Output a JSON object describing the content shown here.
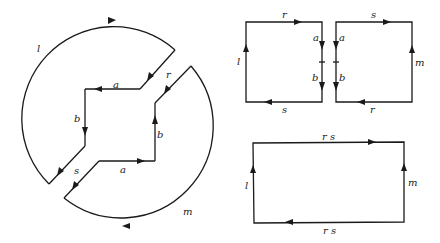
{
  "figure": {
    "left_diagram": {
      "description": "Two-piece surface boundary: outer arcs l and m, inner edges a, b with connecting edges r and s",
      "labels": {
        "l": "l",
        "m": "m",
        "r": "r",
        "s": "s",
        "a_top": "a",
        "a_bottom": "a",
        "b_left": "b",
        "b_right": "b"
      }
    },
    "square_left": {
      "labels": {
        "top": "r",
        "bottom": "s",
        "left": "l",
        "right_upper": "a",
        "right_lower": "b"
      }
    },
    "square_right": {
      "labels": {
        "top": "s",
        "bottom": "r",
        "right": "m",
        "left_upper": "a",
        "left_lower": "b"
      }
    },
    "rectangle": {
      "labels": {
        "top": "r s",
        "bottom": "r s",
        "left": "l",
        "right": "m"
      }
    }
  }
}
